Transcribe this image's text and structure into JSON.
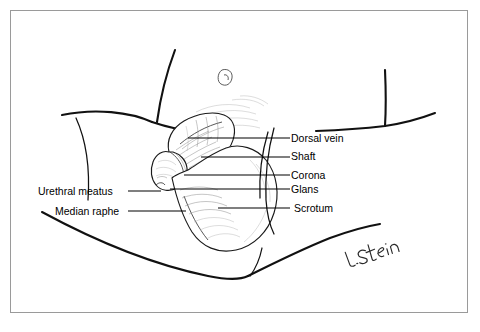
{
  "figure": {
    "kind": "anatomical-line-drawing",
    "background_color": "#ffffff",
    "frame_color": "#9a9a9a",
    "ink_color": "#111111",
    "shading_color": "#8d8d8d"
  },
  "labels": {
    "right": [
      {
        "id": "dorsal-vein",
        "text": "Dorsal vein"
      },
      {
        "id": "shaft",
        "text": "Shaft"
      },
      {
        "id": "corona",
        "text": "Corona"
      },
      {
        "id": "glans",
        "text": "Glans"
      },
      {
        "id": "scrotum",
        "text": "Scrotum"
      }
    ],
    "left": [
      {
        "id": "urethral-meatus",
        "text": "Urethral meatus"
      },
      {
        "id": "median-raphe",
        "text": "Median raphe"
      }
    ]
  },
  "signature": {
    "text": "L. Stein",
    "style": "handwritten-cursive"
  }
}
